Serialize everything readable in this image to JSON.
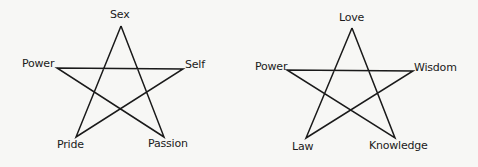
{
  "diagrams": [
    {
      "name": "left-pentagram",
      "vertices": [
        {
          "label": "Sex",
          "x": 121,
          "y": 26
        },
        {
          "label": "Self",
          "x": 183,
          "y": 69
        },
        {
          "label": "Passion",
          "x": 164,
          "y": 137
        },
        {
          "label": "Pride",
          "x": 76,
          "y": 137
        },
        {
          "label": "Power",
          "x": 57,
          "y": 68
        }
      ],
      "labels": {
        "top": "Sex",
        "left": "Power",
        "right": "Self",
        "bottom_left": "Pride",
        "bottom_right": "Passion"
      }
    },
    {
      "name": "right-pentagram",
      "vertices": [
        {
          "label": "Love",
          "x": 352,
          "y": 28
        },
        {
          "label": "Wisdom",
          "x": 413,
          "y": 71
        },
        {
          "label": "Knowledge",
          "x": 395,
          "y": 138
        },
        {
          "label": "Law",
          "x": 306,
          "y": 138
        },
        {
          "label": "Power",
          "x": 287,
          "y": 70
        }
      ],
      "labels": {
        "top": "Love",
        "left": "Power",
        "right": "Wisdom",
        "bottom_left": "Law",
        "bottom_right": "Knowledge"
      }
    }
  ],
  "colors": {
    "stroke": "#1a1a1a",
    "background": "#f7f7f5"
  }
}
